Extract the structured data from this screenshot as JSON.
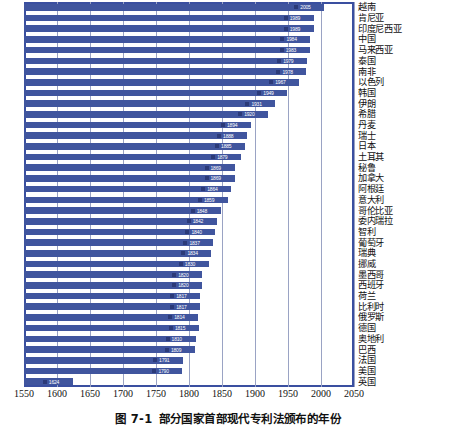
{
  "chart_data": {
    "type": "bar",
    "orientation": "horizontal",
    "title": "部分国家首部现代专利法颁布的年份",
    "figure_number": "图 7-1",
    "xlabel": "",
    "ylabel": "",
    "xlim": [
      1550,
      2050
    ],
    "xticks": [
      "1550",
      "1600",
      "1650",
      "1700",
      "1750",
      "1800",
      "1850",
      "1900",
      "1950",
      "2000",
      "2050"
    ],
    "grid": true,
    "legend": null,
    "bar_color": "#40559e",
    "frame_color": "#3a4fa0",
    "grid_color": "#9aa3c4",
    "categories": [
      "越南",
      "肯尼亚",
      "印度尼西亚",
      "中国",
      "马来西亚",
      "泰国",
      "南非",
      "以色列",
      "韩国",
      "伊朗",
      "希腊",
      "丹麦",
      "瑞士",
      "日本",
      "土耳其",
      "秘鲁",
      "加拿大",
      "阿根廷",
      "意大利",
      "哥伦比亚",
      "委内瑞拉",
      "智利",
      "葡萄牙",
      "瑞典",
      "挪威",
      "墨西哥",
      "西班牙",
      "荷兰",
      "比利时",
      "俄罗斯",
      "德国",
      "奥地利",
      "巴西",
      "法国",
      "美国",
      "英国"
    ],
    "values": [
      2005,
      1989,
      1989,
      1984,
      1983,
      1979,
      1978,
      1967,
      1949,
      1931,
      1920,
      1894,
      1888,
      1885,
      1879,
      1869,
      1869,
      1864,
      1859,
      1848,
      1842,
      1840,
      1837,
      1834,
      1830,
      1820,
      1820,
      1817,
      1817,
      1814,
      1815,
      1810,
      1809,
      1791,
      1790,
      1624
    ],
    "bars": [
      {
        "category": "越南",
        "value": 2005,
        "label": "2005"
      },
      {
        "category": "肯尼亚",
        "value": 1989,
        "label": "1989"
      },
      {
        "category": "印度尼西亚",
        "value": 1989,
        "label": "1989"
      },
      {
        "category": "中国",
        "value": 1984,
        "label": "1984"
      },
      {
        "category": "马来西亚",
        "value": 1983,
        "label": "1983"
      },
      {
        "category": "泰国",
        "value": 1979,
        "label": "1979"
      },
      {
        "category": "南非",
        "value": 1978,
        "label": "1978"
      },
      {
        "category": "以色列",
        "value": 1967,
        "label": "1967"
      },
      {
        "category": "韩国",
        "value": 1949,
        "label": "1949"
      },
      {
        "category": "伊朗",
        "value": 1931,
        "label": "1931"
      },
      {
        "category": "希腊",
        "value": 1920,
        "label": "1920"
      },
      {
        "category": "丹麦",
        "value": 1894,
        "label": "1894"
      },
      {
        "category": "瑞士",
        "value": 1888,
        "label": "1888"
      },
      {
        "category": "日本",
        "value": 1885,
        "label": "1885"
      },
      {
        "category": "土耳其",
        "value": 1879,
        "label": "1879"
      },
      {
        "category": "秘鲁",
        "value": 1869,
        "label": "1869"
      },
      {
        "category": "加拿大",
        "value": 1869,
        "label": "1869"
      },
      {
        "category": "阿根廷",
        "value": 1864,
        "label": "1864"
      },
      {
        "category": "意大利",
        "value": 1859,
        "label": "1859"
      },
      {
        "category": "哥伦比亚",
        "value": 1848,
        "label": "1848"
      },
      {
        "category": "委内瑞拉",
        "value": 1842,
        "label": "1842"
      },
      {
        "category": "智利",
        "value": 1840,
        "label": "1840"
      },
      {
        "category": "葡萄牙",
        "value": 1837,
        "label": "1837"
      },
      {
        "category": "瑞典",
        "value": 1834,
        "label": "1834"
      },
      {
        "category": "挪威",
        "value": 1830,
        "label": "1830"
      },
      {
        "category": "墨西哥",
        "value": 1820,
        "label": "1820"
      },
      {
        "category": "西班牙",
        "value": 1820,
        "label": "1820"
      },
      {
        "category": "荷兰",
        "value": 1817,
        "label": "1817"
      },
      {
        "category": "比利时",
        "value": 1817,
        "label": "1817"
      },
      {
        "category": "俄罗斯",
        "value": 1814,
        "label": "1814"
      },
      {
        "category": "德国",
        "value": 1815,
        "label": "1815"
      },
      {
        "category": "奥地利",
        "value": 1810,
        "label": "1810"
      },
      {
        "category": "巴西",
        "value": 1809,
        "label": "1809"
      },
      {
        "category": "法国",
        "value": 1791,
        "label": "1791"
      },
      {
        "category": "美国",
        "value": 1790,
        "label": "1790"
      },
      {
        "category": "英国",
        "value": 1624,
        "label": "1624"
      }
    ]
  },
  "caption": {
    "number": "图 7-1",
    "text": "部分国家首部现代专利法颁布的年份"
  }
}
